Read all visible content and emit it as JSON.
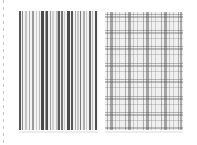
{
  "scene": {
    "description": "Two grayscale fabric swatches side by side: vertical stripes (left) and plaid check (right)",
    "background": "#ffffff"
  },
  "left_swatch": {
    "pattern": "vertical-stripes",
    "x": 19,
    "y": 11,
    "width": 79,
    "height": 119,
    "base_color": "#f2f2f2",
    "stripes": [
      {
        "x": 0,
        "w": 2,
        "color": "#555555"
      },
      {
        "x": 3,
        "w": 1,
        "color": "#8a8a8a"
      },
      {
        "x": 6,
        "w": 2,
        "color": "#c4c4c4"
      },
      {
        "x": 10,
        "w": 1,
        "color": "#b0b0b0"
      },
      {
        "x": 13,
        "w": 2,
        "color": "#9a9a9a"
      },
      {
        "x": 17,
        "w": 1,
        "color": "#cccccc"
      },
      {
        "x": 20,
        "w": 1,
        "color": "#b8b8b8"
      },
      {
        "x": 22,
        "w": 3,
        "color": "#4a4a4a"
      },
      {
        "x": 26,
        "w": 1,
        "color": "#9a9a9a"
      },
      {
        "x": 27,
        "w": 2,
        "color": "#505050"
      },
      {
        "x": 31,
        "w": 1,
        "color": "#9e9e9e"
      },
      {
        "x": 33,
        "w": 2,
        "color": "#d0d0d0"
      },
      {
        "x": 37,
        "w": 2,
        "color": "#bdbdbd"
      },
      {
        "x": 39,
        "w": 2,
        "color": "#5a5a5a"
      },
      {
        "x": 42,
        "w": 2,
        "color": "#777777"
      },
      {
        "x": 45,
        "w": 1,
        "color": "#c8c8c8"
      },
      {
        "x": 48,
        "w": 3,
        "color": "#4a4a4a"
      },
      {
        "x": 52,
        "w": 2,
        "color": "#555555"
      },
      {
        "x": 56,
        "w": 1,
        "color": "#a8a8a8"
      },
      {
        "x": 58,
        "w": 2,
        "color": "#c6c6c6"
      },
      {
        "x": 61,
        "w": 1,
        "color": "#7a7a7a"
      },
      {
        "x": 64,
        "w": 2,
        "color": "#b0b0b0"
      },
      {
        "x": 67,
        "w": 1,
        "color": "#cfcfcf"
      },
      {
        "x": 70,
        "w": 2,
        "color": "#6a6a6a"
      },
      {
        "x": 73,
        "w": 1,
        "color": "#bdbdbd"
      },
      {
        "x": 76,
        "w": 2,
        "color": "#505050"
      }
    ]
  },
  "right_swatch": {
    "pattern": "plaid",
    "x": 105,
    "y": 12,
    "width": 78,
    "height": 118,
    "base_color": "#f0f0f0",
    "vertical_bands": [
      {
        "x": 2,
        "w": 1,
        "color": "rgba(90,90,90,0.45)"
      },
      {
        "x": 5,
        "w": 3,
        "color": "rgba(70,70,70,0.45)"
      },
      {
        "x": 10,
        "w": 1,
        "color": "rgba(120,120,120,0.35)"
      },
      {
        "x": 14,
        "w": 1,
        "color": "rgba(120,120,120,0.3)"
      },
      {
        "x": 20,
        "w": 1,
        "color": "rgba(90,90,90,0.45)"
      },
      {
        "x": 23,
        "w": 3,
        "color": "rgba(70,70,70,0.45)"
      },
      {
        "x": 28,
        "w": 1,
        "color": "rgba(120,120,120,0.35)"
      },
      {
        "x": 32,
        "w": 1,
        "color": "rgba(120,120,120,0.3)"
      },
      {
        "x": 38,
        "w": 1,
        "color": "rgba(90,90,90,0.45)"
      },
      {
        "x": 41,
        "w": 3,
        "color": "rgba(70,70,70,0.45)"
      },
      {
        "x": 46,
        "w": 1,
        "color": "rgba(120,120,120,0.35)"
      },
      {
        "x": 50,
        "w": 1,
        "color": "rgba(120,120,120,0.3)"
      },
      {
        "x": 56,
        "w": 1,
        "color": "rgba(90,90,90,0.45)"
      },
      {
        "x": 59,
        "w": 3,
        "color": "rgba(70,70,70,0.45)"
      },
      {
        "x": 64,
        "w": 1,
        "color": "rgba(120,120,120,0.35)"
      },
      {
        "x": 68,
        "w": 1,
        "color": "rgba(120,120,120,0.3)"
      },
      {
        "x": 73,
        "w": 1,
        "color": "rgba(90,90,90,0.45)"
      },
      {
        "x": 75,
        "w": 2,
        "color": "rgba(70,70,70,0.4)"
      }
    ],
    "horizontal_bands": [
      {
        "y": 2,
        "h": 1,
        "color": "rgba(90,90,90,0.4)"
      },
      {
        "y": 4,
        "h": 2,
        "color": "rgba(80,80,80,0.35)"
      },
      {
        "y": 9,
        "h": 1,
        "color": "rgba(120,120,120,0.3)"
      },
      {
        "y": 18,
        "h": 1,
        "color": "rgba(90,90,90,0.4)"
      },
      {
        "y": 20,
        "h": 2,
        "color": "rgba(80,80,80,0.35)"
      },
      {
        "y": 26,
        "h": 1,
        "color": "rgba(120,120,120,0.3)"
      },
      {
        "y": 34,
        "h": 1,
        "color": "rgba(90,90,90,0.4)"
      },
      {
        "y": 36,
        "h": 2,
        "color": "rgba(80,80,80,0.35)"
      },
      {
        "y": 42,
        "h": 1,
        "color": "rgba(120,120,120,0.3)"
      },
      {
        "y": 51,
        "h": 1,
        "color": "rgba(90,90,90,0.4)"
      },
      {
        "y": 53,
        "h": 2,
        "color": "rgba(80,80,80,0.35)"
      },
      {
        "y": 59,
        "h": 1,
        "color": "rgba(120,120,120,0.3)"
      },
      {
        "y": 67,
        "h": 1,
        "color": "rgba(90,90,90,0.4)"
      },
      {
        "y": 69,
        "h": 2,
        "color": "rgba(80,80,80,0.35)"
      },
      {
        "y": 75,
        "h": 1,
        "color": "rgba(120,120,120,0.3)"
      },
      {
        "y": 84,
        "h": 1,
        "color": "rgba(90,90,90,0.4)"
      },
      {
        "y": 86,
        "h": 2,
        "color": "rgba(80,80,80,0.35)"
      },
      {
        "y": 92,
        "h": 1,
        "color": "rgba(120,120,120,0.3)"
      },
      {
        "y": 100,
        "h": 1,
        "color": "rgba(90,90,90,0.4)"
      },
      {
        "y": 102,
        "h": 2,
        "color": "rgba(80,80,80,0.35)"
      },
      {
        "y": 108,
        "h": 1,
        "color": "rgba(120,120,120,0.3)"
      },
      {
        "y": 115,
        "h": 2,
        "color": "rgba(90,90,90,0.35)"
      }
    ]
  },
  "decorations": {
    "left_dashed_edge_color": "#c8c8c8",
    "shadow_color": "#ececec"
  }
}
